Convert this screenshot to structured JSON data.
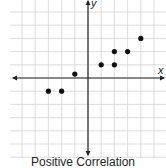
{
  "chart_data": {
    "type": "scatter",
    "title": "Positive Correlation",
    "xlabel": "x",
    "ylabel": "y",
    "grid": true,
    "xlim": [
      -6.5,
      6
    ],
    "ylim": [
      -6,
      6
    ],
    "points": [
      {
        "x": -3,
        "y": -1
      },
      {
        "x": -2,
        "y": -1
      },
      {
        "x": -1,
        "y": 0.3
      },
      {
        "x": 1,
        "y": 1
      },
      {
        "x": 2,
        "y": 1
      },
      {
        "x": 2,
        "y": 2
      },
      {
        "x": 3,
        "y": 2
      },
      {
        "x": 4,
        "y": 3
      }
    ],
    "colors": {
      "grid": "#d4d4d4",
      "axis": "#222222",
      "point": "#111111"
    }
  },
  "labels": {
    "x_axis": "x",
    "y_axis": "y",
    "caption": "Positive Correlation"
  }
}
